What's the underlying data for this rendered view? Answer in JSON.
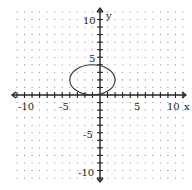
{
  "chart_data": {
    "type": "line",
    "title": "",
    "xlabel": "x",
    "ylabel": "y",
    "xlim": [
      -11,
      11
    ],
    "ylim": [
      -11,
      11
    ],
    "grid": "dots",
    "x_ticks_labeled": [
      -10,
      -5,
      5,
      10
    ],
    "y_ticks_labeled": [
      10,
      5,
      -5,
      -10
    ],
    "tick_labels": {
      "x": [
        "-10",
        "-5",
        "5",
        "10"
      ],
      "y": [
        "10",
        "5",
        "-5",
        "-10"
      ]
    },
    "series": [
      {
        "name": "ellipse",
        "shape": "ellipse",
        "center": [
          -1,
          2
        ],
        "rx": 3,
        "ry": 2,
        "color": "#333333"
      }
    ]
  },
  "labels": {
    "x_axis": "x",
    "y_axis": "y",
    "x_neg10": "-10",
    "x_neg5": "-5",
    "x_5": "5",
    "x_10": "10",
    "y_10": "10",
    "y_5": "5",
    "y_neg5": "-5",
    "y_neg10": "-10"
  }
}
